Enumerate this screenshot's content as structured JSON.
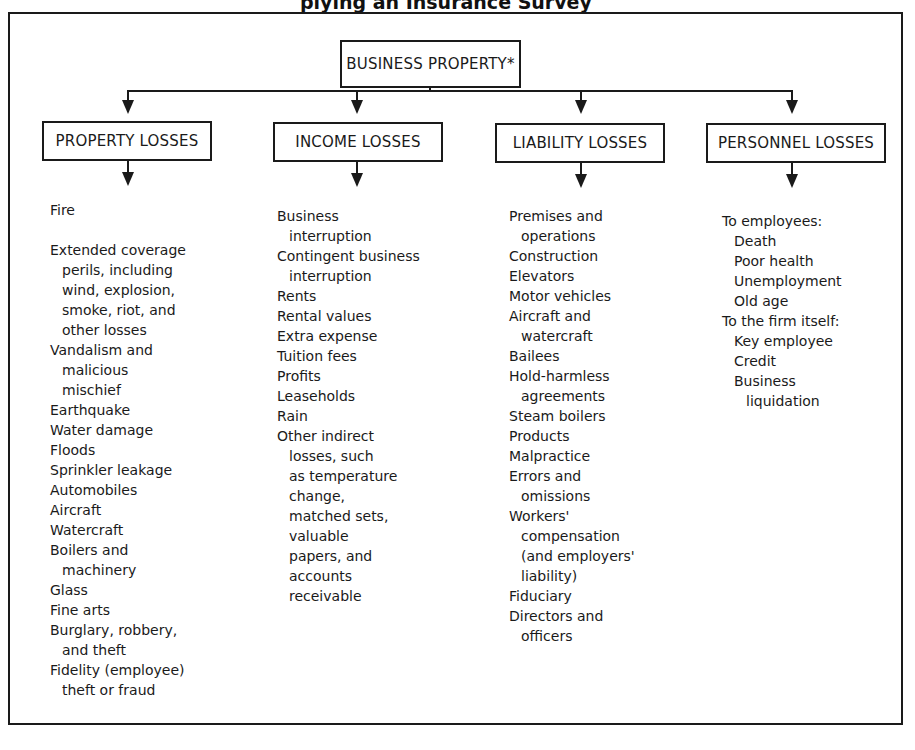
{
  "title": "plying an Insurance Survey",
  "root": {
    "label": "BUSINESS PROPERTY*"
  },
  "categories": [
    {
      "label": "PROPERTY LOSSES",
      "items": [
        {
          "text": "Fire",
          "indent": 0
        },
        {
          "text": "",
          "indent": 0
        },
        {
          "text": "Extended coverage",
          "indent": 0
        },
        {
          "text": "perils, including",
          "indent": 1
        },
        {
          "text": "wind, explosion,",
          "indent": 1
        },
        {
          "text": "smoke, riot, and",
          "indent": 1
        },
        {
          "text": "other losses",
          "indent": 1
        },
        {
          "text": "Vandalism and",
          "indent": 0
        },
        {
          "text": "malicious",
          "indent": 1
        },
        {
          "text": "mischief",
          "indent": 1
        },
        {
          "text": "Earthquake",
          "indent": 0
        },
        {
          "text": "Water damage",
          "indent": 0
        },
        {
          "text": "Floods",
          "indent": 0
        },
        {
          "text": "Sprinkler leakage",
          "indent": 0
        },
        {
          "text": "Automobiles",
          "indent": 0
        },
        {
          "text": "Aircraft",
          "indent": 0
        },
        {
          "text": "Watercraft",
          "indent": 0
        },
        {
          "text": "Boilers and",
          "indent": 0
        },
        {
          "text": "machinery",
          "indent": 1
        },
        {
          "text": "Glass",
          "indent": 0
        },
        {
          "text": "Fine arts",
          "indent": 0
        },
        {
          "text": "Burglary, robbery,",
          "indent": 0
        },
        {
          "text": "and theft",
          "indent": 1
        },
        {
          "text": "Fidelity (employee)",
          "indent": 0
        },
        {
          "text": "theft or fraud",
          "indent": 1
        }
      ]
    },
    {
      "label": "INCOME LOSSES",
      "items": [
        {
          "text": "Business",
          "indent": 0
        },
        {
          "text": "interruption",
          "indent": 1
        },
        {
          "text": "Contingent business",
          "indent": 0
        },
        {
          "text": "interruption",
          "indent": 1
        },
        {
          "text": "Rents",
          "indent": 0
        },
        {
          "text": "Rental values",
          "indent": 0
        },
        {
          "text": "Extra expense",
          "indent": 0
        },
        {
          "text": "Tuition fees",
          "indent": 0
        },
        {
          "text": "Profits",
          "indent": 0
        },
        {
          "text": "Leaseholds",
          "indent": 0
        },
        {
          "text": "Rain",
          "indent": 0
        },
        {
          "text": "Other indirect",
          "indent": 0
        },
        {
          "text": "losses, such",
          "indent": 1
        },
        {
          "text": "as temperature",
          "indent": 1
        },
        {
          "text": "change,",
          "indent": 1
        },
        {
          "text": "matched sets,",
          "indent": 1
        },
        {
          "text": "valuable",
          "indent": 1
        },
        {
          "text": "papers, and",
          "indent": 1
        },
        {
          "text": "accounts",
          "indent": 1
        },
        {
          "text": "receivable",
          "indent": 1
        }
      ]
    },
    {
      "label": "LIABILITY LOSSES",
      "items": [
        {
          "text": "Premises and",
          "indent": 0
        },
        {
          "text": "operations",
          "indent": 1
        },
        {
          "text": "Construction",
          "indent": 0
        },
        {
          "text": "Elevators",
          "indent": 0
        },
        {
          "text": "Motor vehicles",
          "indent": 0
        },
        {
          "text": "Aircraft and",
          "indent": 0
        },
        {
          "text": "watercraft",
          "indent": 1
        },
        {
          "text": "Bailees",
          "indent": 0
        },
        {
          "text": "Hold-harmless",
          "indent": 0
        },
        {
          "text": "agreements",
          "indent": 1
        },
        {
          "text": "Steam boilers",
          "indent": 0
        },
        {
          "text": "Products",
          "indent": 0
        },
        {
          "text": "Malpractice",
          "indent": 0
        },
        {
          "text": "Errors and",
          "indent": 0
        },
        {
          "text": "omissions",
          "indent": 1
        },
        {
          "text": "Workers'",
          "indent": 0
        },
        {
          "text": "compensation",
          "indent": 1
        },
        {
          "text": "(and employers'",
          "indent": 1
        },
        {
          "text": "liability)",
          "indent": 1
        },
        {
          "text": "Fiduciary",
          "indent": 0
        },
        {
          "text": "Directors and",
          "indent": 0
        },
        {
          "text": "officers",
          "indent": 1
        }
      ]
    },
    {
      "label": "PERSONNEL LOSSES",
      "items": [
        {
          "text": "To employees:",
          "indent": 0
        },
        {
          "text": "Death",
          "indent": 1
        },
        {
          "text": "Poor health",
          "indent": 1
        },
        {
          "text": "Unemployment",
          "indent": 1
        },
        {
          "text": "Old age",
          "indent": 1
        },
        {
          "text": "To the firm itself:",
          "indent": 0
        },
        {
          "text": "Key employee",
          "indent": 1
        },
        {
          "text": "Credit",
          "indent": 1
        },
        {
          "text": "Business",
          "indent": 1
        },
        {
          "text": "liquidation",
          "indent": 2
        }
      ]
    }
  ]
}
